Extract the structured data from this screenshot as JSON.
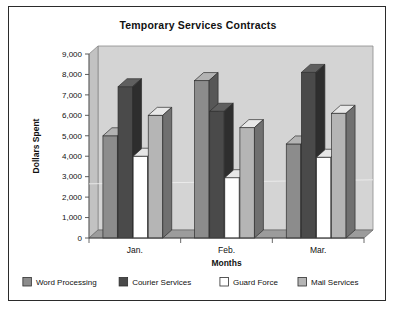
{
  "chart_data": {
    "type": "bar",
    "title": "Temporary Services Contracts",
    "xlabel": "Months",
    "ylabel": "Dollars Spent",
    "categories": [
      "Jan.",
      "Feb.",
      "Mar."
    ],
    "series": [
      {
        "name": "Word Processing",
        "color": "#8c8c8c",
        "values": [
          5000,
          7700,
          4600
        ]
      },
      {
        "name": "Courier Services",
        "color": "#4a4a4a",
        "values": [
          7400,
          6200,
          8100
        ]
      },
      {
        "name": "Guard Force",
        "color": "#ffffff",
        "values": [
          4000,
          2950,
          3950
        ]
      },
      {
        "name": "Mail Services",
        "color": "#b5b5b5",
        "values": [
          6000,
          5400,
          6100
        ]
      }
    ],
    "ylim": [
      0,
      9000
    ],
    "ytick_labels": [
      "9,000",
      "8,000",
      "7,000",
      "6,000",
      "5,000",
      "4,000",
      "3,000",
      "2,000",
      "1,000",
      "0"
    ],
    "ytick_values": [
      9000,
      8000,
      7000,
      6000,
      5000,
      4000,
      3000,
      2000,
      1000,
      0
    ],
    "grid": false,
    "legend_position": "bottom",
    "style": "3d-column",
    "plot_background": "#d4d4d4",
    "border_color": "#2b2b2b"
  },
  "legend": {
    "items": [
      {
        "label": "Word Processing",
        "swatch": "#8c8c8c"
      },
      {
        "label": "Courier Services",
        "swatch": "#4a4a4a"
      },
      {
        "label": "Guard Force",
        "swatch": "#ffffff"
      },
      {
        "label": "Mail Services",
        "swatch": "#b5b5b5"
      }
    ]
  }
}
